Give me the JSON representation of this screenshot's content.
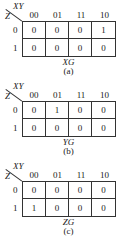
{
  "axis": {
    "col_var": "XY",
    "row_var": "Z"
  },
  "columns": [
    "00",
    "01",
    "11",
    "10"
  ],
  "rows": [
    "0",
    "1"
  ],
  "maps": [
    {
      "function": "XG",
      "caption": "(a)",
      "cells": [
        [
          "0",
          "0",
          "0",
          "1"
        ],
        [
          "0",
          "0",
          "0",
          "0"
        ]
      ]
    },
    {
      "function": "YG",
      "caption": "(b)",
      "cells": [
        [
          "0",
          "1",
          "0",
          "0"
        ],
        [
          "0",
          "0",
          "0",
          "0"
        ]
      ]
    },
    {
      "function": "ZG",
      "caption": "(c)",
      "cells": [
        [
          "0",
          "0",
          "0",
          "0"
        ],
        [
          "1",
          "0",
          "0",
          "0"
        ]
      ]
    }
  ]
}
